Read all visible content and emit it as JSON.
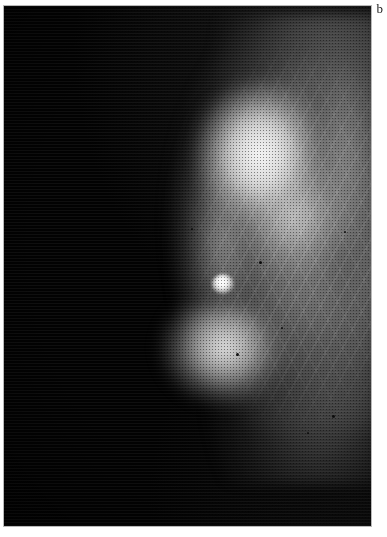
{
  "figure": {
    "panel_label": "b",
    "modality_name": "mammogram",
    "background_color": "#ffffff",
    "film_color": "#000000",
    "frame_border_color": "#b9b9b9",
    "label_color": "#1a1a1a",
    "highlight_color": "#ffffff",
    "midtone_color": "#969696",
    "shadow_color": "#020202",
    "plate": {
      "left": 4,
      "top": 6,
      "width": 367,
      "height": 520
    },
    "regions": [
      {
        "name": "breast-mass",
        "description": "breast parenchyma silhouette"
      },
      {
        "name": "glandular-core",
        "description": "dense fibroglandular tissue"
      },
      {
        "name": "glandular-lobule-lower",
        "description": "inferior dense lobule"
      },
      {
        "name": "posterior-haze",
        "description": "retroglandular region at chest wall"
      },
      {
        "name": "skin-margin",
        "description": "anterior skin line margin"
      },
      {
        "name": "trabecular-streaks",
        "description": "fibrous trabecular strands"
      },
      {
        "name": "focal-nodule",
        "description": "focal bright opacity"
      }
    ],
    "punctate_markers": [
      {
        "x": 259,
        "y": 261,
        "size": 3
      },
      {
        "x": 236,
        "y": 353,
        "size": 3
      },
      {
        "x": 332,
        "y": 415,
        "size": 3
      },
      {
        "x": 307,
        "y": 432,
        "size": 2
      },
      {
        "x": 344,
        "y": 231,
        "size": 2
      },
      {
        "x": 281,
        "y": 327,
        "size": 2
      },
      {
        "x": 191,
        "y": 228,
        "size": 2
      }
    ]
  }
}
